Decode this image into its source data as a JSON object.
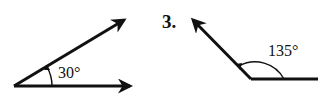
{
  "figures": [
    {
      "id": "angle-30",
      "label": "30°",
      "measure_degrees": 30,
      "vertex": [
        14,
        86
      ],
      "rays": [
        [
          132,
          86
        ],
        [
          126,
          19
        ]
      ]
    },
    {
      "id": "angle-135",
      "problem_number": "3.",
      "label": "135°",
      "measure_degrees": 135,
      "vertex": [
        251,
        79
      ],
      "rays": [
        [
          318,
          79
        ],
        [
          191,
          18
        ]
      ]
    }
  ],
  "colors": {
    "ink": "#111111",
    "background": "#ffffff"
  }
}
